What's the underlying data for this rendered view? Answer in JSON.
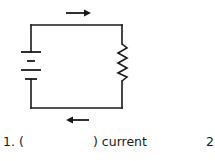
{
  "diagram": {
    "type": "circuit",
    "components": [
      {
        "kind": "battery",
        "position": "left",
        "cells": 2
      },
      {
        "kind": "resistor",
        "position": "right"
      },
      {
        "kind": "arrow",
        "position": "top",
        "direction": "right"
      },
      {
        "kind": "arrow",
        "position": "bottom",
        "direction": "left"
      }
    ],
    "colors": {
      "wire": "#1a1a1a",
      "background": "#ffffff"
    }
  },
  "question": {
    "number_prefix": "1. (",
    "blank": "",
    "suffix": ") current",
    "next_number": "2"
  }
}
